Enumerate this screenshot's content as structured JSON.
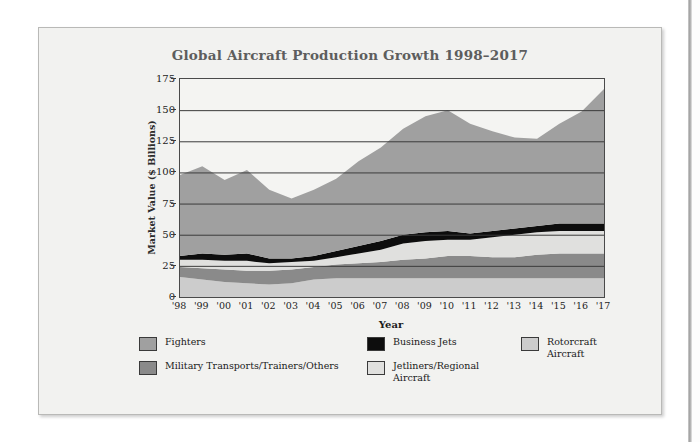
{
  "chart_data": {
    "type": "area",
    "title": "Global Aircraft Production Growth 1998–2017",
    "xlabel": "Year",
    "ylabel": "Market Value ($ Billions)",
    "ylim": [
      0,
      175
    ],
    "yticks": [
      0,
      25,
      50,
      75,
      100,
      125,
      150,
      175
    ],
    "grid": true,
    "legend_position": "below",
    "stacked": true,
    "x": [
      1998,
      1999,
      2000,
      2001,
      2002,
      2003,
      2004,
      2005,
      2006,
      2007,
      2008,
      2009,
      2010,
      2011,
      2012,
      2013,
      2014,
      2015,
      2016,
      2017
    ],
    "categories": [
      "'98",
      "'99",
      "'00",
      "'01",
      "'02",
      "'03",
      "'04",
      "'05",
      "'06",
      "'07",
      "'08",
      "'09",
      "'10",
      "'11",
      "'12",
      "'13",
      "'14",
      "'15",
      "'16",
      "'17"
    ],
    "stack_order_bottom_to_top": [
      "Rotorcraft Aircraft",
      "Military Transports/Trainers/Others",
      "Jetliners/Regional Aircraft",
      "Business Jets",
      "Fighters"
    ],
    "series": [
      {
        "name": "Rotorcraft Aircraft",
        "color": "#cccccc",
        "values": [
          16,
          14,
          12,
          11,
          10,
          11,
          14,
          15,
          15,
          15,
          15,
          15,
          15,
          15,
          15,
          15,
          15,
          15,
          15,
          15
        ]
      },
      {
        "name": "Military Transports/Trainers/Others",
        "color": "#8a8a8a",
        "values": [
          8,
          9,
          10,
          10,
          11,
          11,
          10,
          11,
          12,
          13,
          15,
          16,
          18,
          18,
          17,
          17,
          19,
          20,
          20,
          20
        ]
      },
      {
        "name": "Jetliners/Regional Aircraft",
        "color": "#e0e0de",
        "values": [
          6,
          7,
          7,
          8,
          6,
          6,
          5,
          6,
          8,
          10,
          13,
          14,
          13,
          13,
          16,
          18,
          18,
          18,
          18,
          18
        ]
      },
      {
        "name": "Business Jets",
        "color": "#0d0d0d",
        "values": [
          3,
          5,
          5,
          6,
          4,
          3,
          4,
          5,
          6,
          7,
          7,
          7,
          7,
          5,
          5,
          5,
          5,
          6,
          6,
          6
        ]
      },
      {
        "name": "Fighters",
        "color": "#a0a0a0",
        "values": [
          65,
          70,
          60,
          67,
          55,
          48,
          53,
          58,
          68,
          75,
          85,
          93,
          97,
          88,
          80,
          73,
          70,
          80,
          90,
          108
        ]
      }
    ],
    "series_totals": [
      98,
      105,
      94,
      102,
      86,
      79,
      86,
      95,
      109,
      120,
      135,
      145,
      150,
      139,
      133,
      128,
      127,
      139,
      149,
      167
    ]
  },
  "legend": {
    "items": [
      {
        "label": "Fighters",
        "color": "#a0a0a0"
      },
      {
        "label": "Military Transports/Trainers/Others",
        "color": "#8a8a8a"
      },
      {
        "label": "Business Jets",
        "color": "#0d0d0d"
      },
      {
        "label": "Jetliners/Regional\nAircraft",
        "color": "#e0e0de"
      },
      {
        "label": "Rotorcraft\nAircraft",
        "color": "#cccccc"
      }
    ]
  },
  "colors": {
    "card_background": "#f2f2f0",
    "title_text": "#5d5d5d",
    "axis_text": "#1c1c1c",
    "plot_border": "#4a4a4a",
    "gridline": "#3b3b3b"
  }
}
